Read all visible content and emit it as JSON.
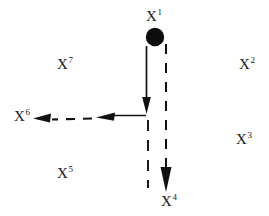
{
  "figure": {
    "background_color": "#ffffff",
    "ink_color": "#111111",
    "width": 269,
    "height": 216
  },
  "nodes": [
    {
      "id": "x1",
      "label": "X",
      "superscript": "1",
      "marker": "filled-circle",
      "x": 155,
      "y": 37,
      "radius": 9
    },
    {
      "id": "x2",
      "label": "X",
      "superscript": "2",
      "marker": "none",
      "x": 245,
      "y": 64
    },
    {
      "id": "x3",
      "label": "X",
      "superscript": "3",
      "marker": "none",
      "x": 242,
      "y": 139
    },
    {
      "id": "x4",
      "label": "X",
      "superscript": "4",
      "marker": "none",
      "x": 167,
      "y": 201
    },
    {
      "id": "x5",
      "label": "X",
      "superscript": "5",
      "marker": "none",
      "x": 63,
      "y": 173
    },
    {
      "id": "x6",
      "label": "X",
      "superscript": "6",
      "marker": "none",
      "x": 20,
      "y": 116
    },
    {
      "id": "x7",
      "label": "X",
      "superscript": "7",
      "marker": "none",
      "x": 63,
      "y": 64
    }
  ],
  "edges": [
    {
      "id": "edge-x1-junction",
      "from": "x1",
      "to": "junction",
      "style": "solid",
      "arrowhead": "filled-triangle",
      "direction": "down"
    },
    {
      "id": "edge-junction-left",
      "from": "junction",
      "to": "midpoint-left",
      "style": "solid",
      "arrowhead": "filled-triangle",
      "direction": "left"
    },
    {
      "id": "edge-left-x6",
      "from": "midpoint-left",
      "to": "x6",
      "style": "dashed",
      "arrowhead": "filled-triangle",
      "direction": "left"
    },
    {
      "id": "edge-x1-x4",
      "from": "x1",
      "to": "x4",
      "style": "dashed",
      "arrowhead": "filled-triangle",
      "direction": "down"
    },
    {
      "id": "edge-junction-down",
      "from": "junction",
      "to": "lower-stub",
      "style": "dashed",
      "arrowhead": "none",
      "direction": "down"
    }
  ]
}
